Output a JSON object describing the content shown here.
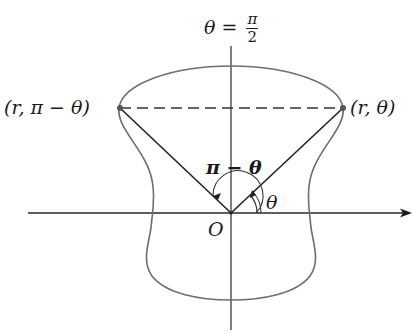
{
  "diagram": {
    "title_label": {
      "lhs": "θ",
      "eq": " = ",
      "num": "π",
      "den": "2"
    },
    "point_left_label": "(r, π − θ)",
    "point_right_label": "(r, θ)",
    "angle_pi_minus_theta_label": "π − θ",
    "angle_theta_label": "θ",
    "origin_label": "O",
    "colors": {
      "curve": "#6e6e6e",
      "axes": "#2a2a2a",
      "rays": "#222222",
      "dashed_line": "#333333",
      "points": "#555555"
    }
  }
}
